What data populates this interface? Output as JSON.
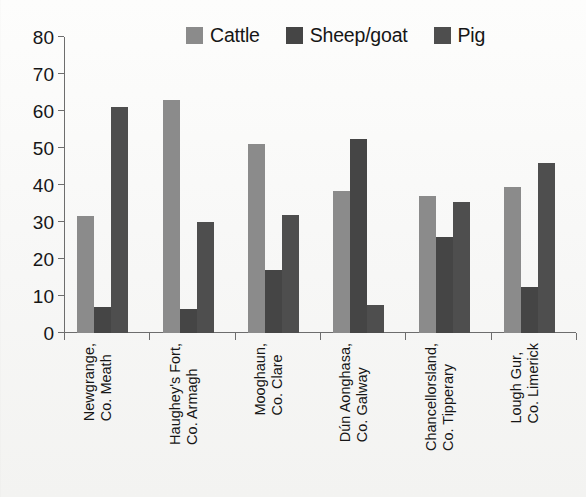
{
  "chart_data": {
    "type": "bar",
    "title": "",
    "subtitle": "",
    "xlabel": "",
    "ylabel": "",
    "ylim": [
      0,
      80
    ],
    "yticks": [
      0,
      10,
      20,
      30,
      40,
      50,
      60,
      70,
      80
    ],
    "ytick_labels": [
      "0",
      "10",
      "20",
      "30",
      "40",
      "50",
      "60",
      "70",
      "80"
    ],
    "grid": false,
    "legend_position": "top-center",
    "categories": [
      "Newgrange, Co. Meath",
      "Haughey's Fort, Co. Armagh",
      "Mooghaun, Co. Clare",
      "Dún Aonghasa, Co. Galway",
      "Chancellorsland, Co. Tipperary",
      "Lough Gur, Co. Limerick"
    ],
    "category_lines": [
      [
        "Newgrange,",
        "Co. Meath"
      ],
      [
        "Haughey's Fort,",
        "Co. Armagh"
      ],
      [
        "Mooghaun,",
        "Co. Clare"
      ],
      [
        "Dún Aonghasa,",
        "Co. Galway"
      ],
      [
        "Chancellorsland,",
        "Co. Tipperary"
      ],
      [
        "Lough Gur,",
        "Co. Limerick"
      ]
    ],
    "series": [
      {
        "name": "Cattle",
        "color": "#8b8b8b",
        "values": [
          31.5,
          63.0,
          51.0,
          38.5,
          37.0,
          39.5
        ]
      },
      {
        "name": "Sheep/goat",
        "color": "#454545",
        "values": [
          7.0,
          6.5,
          17.0,
          52.5,
          26.0,
          12.5
        ]
      },
      {
        "name": "Pig",
        "color": "#4e4e4e",
        "values": [
          61.0,
          30.0,
          32.0,
          7.5,
          35.5,
          46.0
        ]
      }
    ]
  },
  "legend": {
    "entries": [
      {
        "label": "Cattle",
        "color": "#8b8b8b",
        "swatch_name": "legend-swatch-cattle"
      },
      {
        "label": "Sheep/goat",
        "color": "#454545",
        "swatch_name": "legend-swatch-sheep-goat"
      },
      {
        "label": "Pig",
        "color": "#4e4e4e",
        "swatch_name": "legend-swatch-pig"
      }
    ]
  },
  "axes": {
    "y_ticks": [
      "80",
      "70",
      "60",
      "50",
      "40",
      "30",
      "20",
      "10",
      "0"
    ]
  }
}
